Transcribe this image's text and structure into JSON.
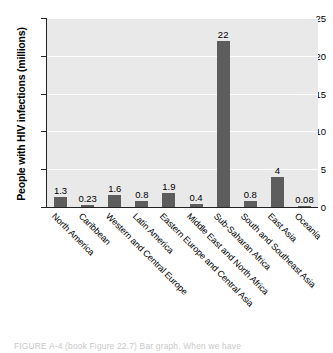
{
  "chart_data": {
    "type": "bar",
    "title": "",
    "xlabel": "",
    "ylabel": "People with HIV infections (millions)",
    "ylim": [
      0,
      25
    ],
    "yticks": [
      0,
      5,
      10,
      15,
      20,
      25
    ],
    "grid": true,
    "legend": null,
    "bar_color": "#5d5d5d",
    "plot_background": "#e9e9e9",
    "categories": [
      "North America",
      "Caribbean",
      "Western and Central Europe",
      "Latin America",
      "Eastern Europe and Central Asia",
      "Middle East and North Africa",
      "Sub-Saharan Africa",
      "South and Southeast Asia",
      "East Asia",
      "Oceania"
    ],
    "values": [
      1.3,
      0.23,
      1.6,
      0.8,
      1.9,
      0.4,
      22,
      0.8,
      4,
      0.08
    ],
    "value_labels": [
      "1.3",
      "0.23",
      "1.6",
      "0.8",
      "1.9",
      "0.4",
      "22",
      "0.8",
      "4",
      "0.08"
    ]
  },
  "caption": {
    "text": "FIGURE  A-4   (book Figure 22.7)   Bar graph.   When we have"
  }
}
